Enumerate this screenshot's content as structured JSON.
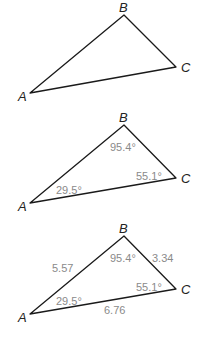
{
  "figures": [
    {
      "vertices": {
        "A": "A",
        "B": "B",
        "C": "C"
      },
      "angles": {},
      "sides": {}
    },
    {
      "vertices": {
        "A": "A",
        "B": "B",
        "C": "C"
      },
      "angles": {
        "A": "29.5°",
        "B": "95.4°",
        "C": "55.1°"
      },
      "sides": {}
    },
    {
      "vertices": {
        "A": "A",
        "B": "B",
        "C": "C"
      },
      "angles": {
        "A": "29.5°",
        "B": "95.4°",
        "C": "55.1°"
      },
      "sides": {
        "AB": "5.57",
        "BC": "3.34",
        "AC": "6.76"
      }
    }
  ],
  "colors": {
    "edge": "#1a1a1a",
    "vertex_label": "#222222",
    "measure_label": "#8a8a8a"
  }
}
